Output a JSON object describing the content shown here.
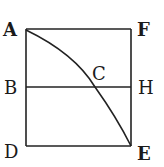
{
  "diagram": {
    "type": "geometric-figure",
    "colors": {
      "background": "#ffffff",
      "ink": "#222222"
    },
    "points": {
      "A": {
        "label": "A"
      },
      "F": {
        "label": "F"
      },
      "B": {
        "label": "B"
      },
      "C": {
        "label": "C"
      },
      "H": {
        "label": "H"
      },
      "D": {
        "label": "D"
      },
      "E": {
        "label": "E"
      }
    },
    "segments": [
      "AF",
      "AD",
      "FE",
      "DE",
      "BH"
    ],
    "curves": [
      "A-C-E"
    ]
  }
}
